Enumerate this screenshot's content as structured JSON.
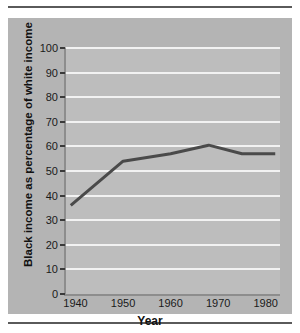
{
  "figure": {
    "background": "#ffffff",
    "card_color": "#b4b4b4",
    "plot_color": "#bdbdbd",
    "gridline_color": "#f2f2f2",
    "rule_color": "#5a5a5a"
  },
  "chart_data": {
    "type": "line",
    "title": "",
    "subtitle": "",
    "xlabel": "Year",
    "ylabel": "Black income as  percentage of white income",
    "xlim": [
      1938,
      1983
    ],
    "ylim": [
      0,
      100
    ],
    "xticks": [
      1940,
      1950,
      1960,
      1970,
      1980
    ],
    "xtick_labels": [
      "1940",
      "1950",
      "1960",
      "1970",
      "1980"
    ],
    "yticks": [
      0,
      10,
      20,
      30,
      40,
      50,
      60,
      70,
      80,
      90,
      100
    ],
    "ytick_labels": [
      "0",
      "10",
      "20",
      "30",
      "40",
      "50",
      "60",
      "70",
      "80",
      "90",
      "100"
    ],
    "grid": "horizontal",
    "legend": "none",
    "series": [
      {
        "name": "Black income as percentage of white income",
        "color": "#4a4a4a",
        "line_width": 3,
        "x": [
          1939,
          1950,
          1960,
          1968,
          1975,
          1982
        ],
        "values": [
          36,
          54,
          57,
          60.5,
          57,
          57
        ]
      }
    ]
  }
}
